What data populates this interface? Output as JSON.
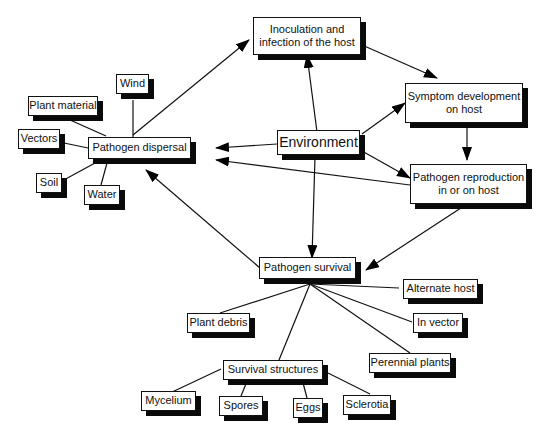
{
  "diagram": {
    "type": "flowchart",
    "nodes": {
      "inoculation": {
        "line1": "Inoculation and",
        "line2": "infection of the host"
      },
      "symptom": {
        "line1": "Symptom  development",
        "line2": "on host"
      },
      "reproduction": {
        "line1": "Pathogen reproduction",
        "line2": "in or on host"
      },
      "environment": {
        "label": "Environment"
      },
      "dispersal": {
        "label": "Pathogen dispersal"
      },
      "survival": {
        "label": "Pathogen  survival"
      },
      "wind": {
        "label": "Wind"
      },
      "plant_material": {
        "label": "Plant material"
      },
      "vectors": {
        "label": "Vectors"
      },
      "soil": {
        "label": "Soil"
      },
      "water": {
        "label": "Water"
      },
      "alternate_host": {
        "label": "Alternate host"
      },
      "in_vector": {
        "label": "In vector"
      },
      "perennial_plants": {
        "label": "Perennial plants"
      },
      "plant_debris": {
        "label": "Plant debris"
      },
      "survival_structures": {
        "label": "Survival structures"
      },
      "mycelium": {
        "label": "Mycelium"
      },
      "spores": {
        "label": "Spores"
      },
      "eggs": {
        "label": "Eggs"
      },
      "sclerotia": {
        "label": "Sclerotia"
      }
    },
    "edges": [
      {
        "from": "dispersal",
        "to": "inoculation",
        "arrow": true
      },
      {
        "from": "inoculation",
        "to": "symptom",
        "arrow": true
      },
      {
        "from": "symptom",
        "to": "reproduction",
        "arrow": true
      },
      {
        "from": "reproduction",
        "to": "dispersal",
        "arrow": true
      },
      {
        "from": "reproduction",
        "to": "survival",
        "arrow": true
      },
      {
        "from": "survival",
        "to": "dispersal",
        "arrow": true
      },
      {
        "from": "environment",
        "to": "inoculation",
        "arrow": true
      },
      {
        "from": "environment",
        "to": "symptom",
        "arrow": true
      },
      {
        "from": "environment",
        "to": "reproduction",
        "arrow": true
      },
      {
        "from": "environment",
        "to": "dispersal",
        "arrow": true
      },
      {
        "from": "environment",
        "to": "survival",
        "arrow": true
      },
      {
        "from": "wind",
        "to": "dispersal",
        "arrow": false
      },
      {
        "from": "plant_material",
        "to": "dispersal",
        "arrow": false
      },
      {
        "from": "vectors",
        "to": "dispersal",
        "arrow": false
      },
      {
        "from": "soil",
        "to": "dispersal",
        "arrow": false
      },
      {
        "from": "water",
        "to": "dispersal",
        "arrow": false
      },
      {
        "from": "survival",
        "to": "alternate_host",
        "arrow": false
      },
      {
        "from": "survival",
        "to": "in_vector",
        "arrow": false
      },
      {
        "from": "survival",
        "to": "perennial_plants",
        "arrow": false
      },
      {
        "from": "survival",
        "to": "plant_debris",
        "arrow": false
      },
      {
        "from": "survival",
        "to": "survival_structures",
        "arrow": false
      },
      {
        "from": "survival_structures",
        "to": "mycelium",
        "arrow": false
      },
      {
        "from": "survival_structures",
        "to": "spores",
        "arrow": false
      },
      {
        "from": "survival_structures",
        "to": "eggs",
        "arrow": false
      },
      {
        "from": "survival_structures",
        "to": "sclerotia",
        "arrow": false
      }
    ]
  }
}
